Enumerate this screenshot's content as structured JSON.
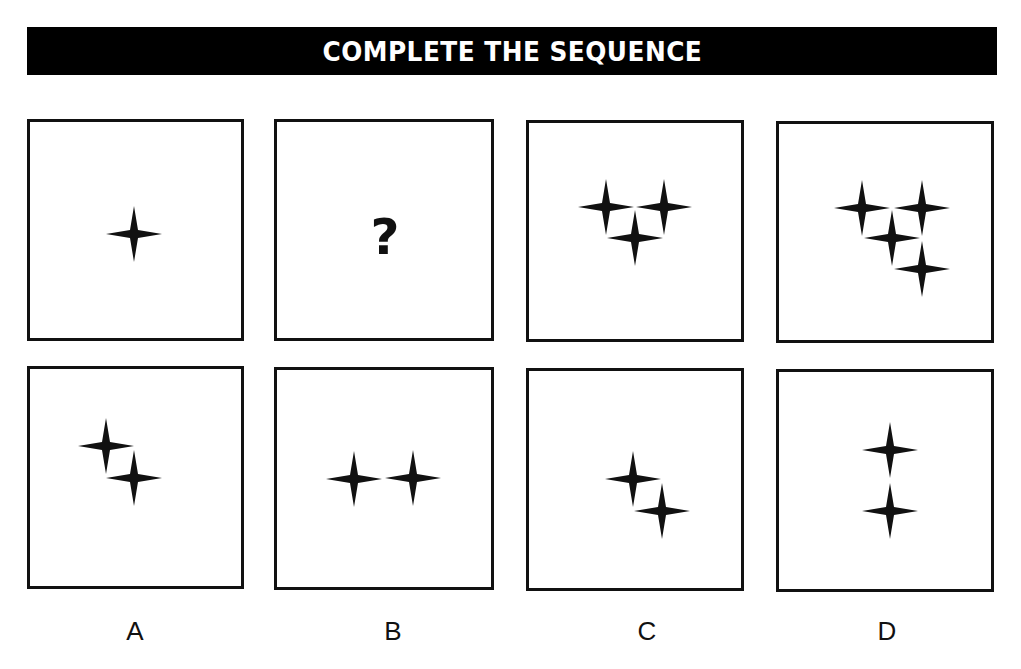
{
  "banner": {
    "title": "COMPLETE THE SEQUENCE"
  },
  "colors": {
    "banner_bg": "#000000",
    "banner_text": "#ffffff",
    "border": "#111111",
    "star": "#111111"
  },
  "sequence": {
    "panels": [
      {
        "id": "seq-1",
        "star_count": 1,
        "stars": [
          [
            134,
            234
          ]
        ]
      },
      {
        "id": "seq-2",
        "content": "?",
        "missing": true
      },
      {
        "id": "seq-3",
        "star_count": 3,
        "stars": [
          [
            606,
            207
          ],
          [
            664,
            207
          ],
          [
            635,
            238
          ]
        ]
      },
      {
        "id": "seq-4",
        "star_count": 4,
        "stars": [
          [
            862,
            208
          ],
          [
            922,
            208
          ],
          [
            892,
            238
          ],
          [
            922,
            269
          ]
        ]
      }
    ]
  },
  "options": [
    {
      "label": "A",
      "star_count": 2,
      "stars": [
        [
          106,
          446
        ],
        [
          134,
          478
        ]
      ]
    },
    {
      "label": "B",
      "star_count": 2,
      "stars": [
        [
          354,
          479
        ],
        [
          413,
          478
        ]
      ]
    },
    {
      "label": "C",
      "star_count": 2,
      "stars": [
        [
          633,
          479
        ],
        [
          662,
          511
        ]
      ]
    },
    {
      "label": "D",
      "star_count": 2,
      "stars": [
        [
          890,
          450
        ],
        [
          890,
          511
        ]
      ]
    }
  ],
  "question_mark": "?"
}
